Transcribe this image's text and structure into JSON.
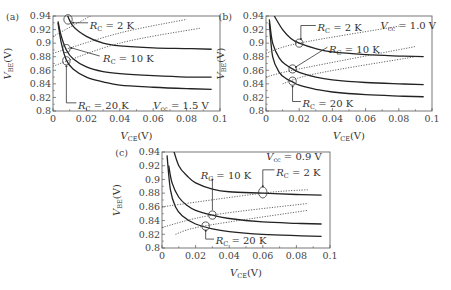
{
  "chart_data": [
    {
      "panel": "(a)",
      "type": "line",
      "xlabel": "V_CE(V)",
      "ylabel": "V_BE(V)",
      "xlim": [
        0,
        0.1
      ],
      "ylim": [
        0.8,
        0.94
      ],
      "xticks": [
        "0",
        "0.02",
        "0.04",
        "0.06",
        "0.08",
        "0.1"
      ],
      "yticks": [
        "0.8",
        "0.82",
        "0.84",
        "0.86",
        "0.88",
        "0.9",
        "0.92",
        "0.94"
      ],
      "annotation": "V_cc = 1.5 V",
      "series": [
        {
          "name": "R_C = 2 K",
          "style": "solid",
          "x": [
            0.008,
            0.012,
            0.02,
            0.03,
            0.04,
            0.06,
            0.08,
            0.095
          ],
          "y": [
            0.945,
            0.925,
            0.91,
            0.9,
            0.896,
            0.893,
            0.892,
            0.891
          ]
        },
        {
          "name": "R_C = 10 K",
          "style": "solid",
          "x": [
            0.003,
            0.005,
            0.008,
            0.012,
            0.02,
            0.03,
            0.04,
            0.06,
            0.08,
            0.095
          ],
          "y": [
            0.932,
            0.91,
            0.89,
            0.877,
            0.865,
            0.858,
            0.855,
            0.852,
            0.85,
            0.85
          ]
        },
        {
          "name": "R_C = 20 K",
          "style": "solid",
          "x": [
            0.003,
            0.005,
            0.008,
            0.012,
            0.02,
            0.03,
            0.04,
            0.06,
            0.08,
            0.095
          ],
          "y": [
            0.93,
            0.9,
            0.875,
            0.862,
            0.85,
            0.843,
            0.838,
            0.835,
            0.833,
            0.832
          ]
        },
        {
          "name": "load line 2 K",
          "style": "dotted",
          "x": [
            0.0,
            0.03
          ],
          "y": [
            0.91,
            0.95
          ]
        },
        {
          "name": "load line 10 K",
          "style": "dotted",
          "x": [
            0.0,
            0.04,
            0.08
          ],
          "y": [
            0.885,
            0.915,
            0.935
          ]
        },
        {
          "name": "load line 20 K",
          "style": "dotted",
          "x": [
            0.0,
            0.04,
            0.088
          ],
          "y": [
            0.866,
            0.9,
            0.922
          ]
        }
      ],
      "labels": [
        "R_C = 2 K",
        "R_C = 10 K",
        "R_C = 20 K"
      ]
    },
    {
      "panel": "(b)",
      "type": "line",
      "xlabel": "V_CE(V)",
      "ylabel": "V_BE(V)",
      "xlim": [
        0,
        0.1
      ],
      "ylim": [
        0.8,
        0.94
      ],
      "xticks": [
        "0",
        "0.02",
        "0.04",
        "0.06",
        "0.08",
        "0.1"
      ],
      "yticks": [
        "0.8",
        "0.82",
        "0.84",
        "0.86",
        "0.88",
        "0.9",
        "0.92",
        "0.94"
      ],
      "annotation": "V_cc = 1.0 V",
      "series": [
        {
          "name": "R_C = 2 K",
          "style": "solid",
          "x": [
            0.005,
            0.01,
            0.015,
            0.02,
            0.03,
            0.04,
            0.06,
            0.08,
            0.095
          ],
          "y": [
            0.94,
            0.92,
            0.907,
            0.9,
            0.892,
            0.887,
            0.883,
            0.881,
            0.88
          ]
        },
        {
          "name": "R_C = 10 K",
          "style": "solid",
          "x": [
            0.002,
            0.004,
            0.008,
            0.012,
            0.016,
            0.02,
            0.03,
            0.04,
            0.06,
            0.08,
            0.095
          ],
          "y": [
            0.935,
            0.9,
            0.878,
            0.868,
            0.862,
            0.857,
            0.85,
            0.846,
            0.842,
            0.84,
            0.839
          ]
        },
        {
          "name": "R_C = 20 K",
          "style": "solid",
          "x": [
            0.002,
            0.004,
            0.008,
            0.012,
            0.016,
            0.02,
            0.03,
            0.04,
            0.06,
            0.08,
            0.095
          ],
          "y": [
            0.93,
            0.88,
            0.857,
            0.848,
            0.843,
            0.838,
            0.832,
            0.828,
            0.824,
            0.822,
            0.821
          ]
        },
        {
          "name": "load line 2 K",
          "style": "dotted",
          "x": [
            0.0,
            0.02,
            0.08
          ],
          "y": [
            0.885,
            0.9,
            0.925
          ]
        },
        {
          "name": "load line 10 K",
          "style": "dotted",
          "x": [
            0.0,
            0.02,
            0.09
          ],
          "y": [
            0.85,
            0.862,
            0.895
          ]
        },
        {
          "name": "load line 20 K",
          "style": "dotted",
          "x": [
            0.01,
            0.03,
            0.09
          ],
          "y": [
            0.84,
            0.855,
            0.88
          ]
        }
      ],
      "labels": [
        "R_C = 2 K",
        "R_C = 10 K",
        "R_C = 20 K"
      ]
    },
    {
      "panel": "(c)",
      "type": "line",
      "xlabel": "V_CE(V)",
      "ylabel": "V_BE(V)",
      "xlim": [
        0,
        0.1
      ],
      "ylim": [
        0.8,
        0.94
      ],
      "xticks": [
        "0",
        "0.02",
        "0.04",
        "0.06",
        "0.08",
        "0.1"
      ],
      "yticks": [
        "0.8",
        "0.82",
        "0.84",
        "0.86",
        "0.88",
        "0.9",
        "0.92",
        "0.94"
      ],
      "annotation": "V_cc = 0.9 V",
      "series": [
        {
          "name": "R_C = 2 K",
          "style": "solid",
          "x": [
            0.006,
            0.01,
            0.015,
            0.02,
            0.03,
            0.04,
            0.06,
            0.08,
            0.095
          ],
          "y": [
            0.95,
            0.92,
            0.905,
            0.895,
            0.886,
            0.882,
            0.88,
            0.878,
            0.877
          ]
        },
        {
          "name": "R_C = 10 K",
          "style": "solid",
          "x": [
            0.004,
            0.006,
            0.01,
            0.015,
            0.02,
            0.03,
            0.04,
            0.06,
            0.08,
            0.095
          ],
          "y": [
            0.92,
            0.895,
            0.874,
            0.862,
            0.855,
            0.848,
            0.843,
            0.838,
            0.836,
            0.835
          ]
        },
        {
          "name": "R_C = 20 K",
          "style": "solid",
          "x": [
            0.003,
            0.005,
            0.008,
            0.012,
            0.02,
            0.03,
            0.04,
            0.06,
            0.08,
            0.095
          ],
          "y": [
            0.935,
            0.885,
            0.86,
            0.847,
            0.835,
            0.828,
            0.824,
            0.82,
            0.818,
            0.817
          ]
        },
        {
          "name": "load line 2 K",
          "style": "dotted",
          "x": [
            0.0,
            0.06,
            0.087
          ],
          "y": [
            0.86,
            0.88,
            0.885
          ]
        },
        {
          "name": "load line 10 K",
          "style": "dotted",
          "x": [
            0.0,
            0.03,
            0.087
          ],
          "y": [
            0.83,
            0.848,
            0.865
          ]
        },
        {
          "name": "load line 20 K",
          "style": "dotted",
          "x": [
            0.008,
            0.025,
            0.087
          ],
          "y": [
            0.82,
            0.832,
            0.855
          ]
        }
      ],
      "labels": [
        "R_C = 10 K",
        "R_C = 2 K",
        "R_C = 20 K"
      ]
    }
  ],
  "panels": {
    "a": {
      "tag": "(a)",
      "vcc": "V",
      "vcc_sub": "cc",
      "vcc_val": " = 1.5 V",
      "rc2": " = 2 K",
      "rc10": " = 10 K",
      "rc20": " = 20 K"
    },
    "b": {
      "tag": "(b)",
      "vcc": "V",
      "vcc_sub": "cc",
      "vcc_val": " = 1.0 V",
      "rc2": " = 2 K",
      "rc10": " = 10 K",
      "rc20": " = 20 K"
    },
    "c": {
      "tag": "(c)",
      "vcc": "V",
      "vcc_sub": "cc",
      "vcc_val": " = 0.9 V",
      "rc2": " = 2 K",
      "rc10": " = 10 K",
      "rc20": " = 20 K"
    }
  },
  "axis": {
    "x_main": "V",
    "x_sub": "CE",
    "x_unit": "(V)",
    "y_main": "V",
    "y_sub": "BE",
    "y_unit": "(V)",
    "r_main": "R",
    "r_sub": "C"
  }
}
